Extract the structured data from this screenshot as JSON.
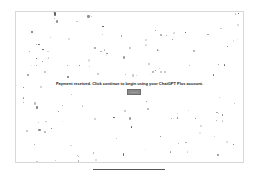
{
  "dialog": {
    "message": "Payment received. Click continue to begin using your ChatGPT Plus account.",
    "continue_label": "Continue"
  },
  "footer": {
    "text": "· · · · · · · · · · · · · · · ·"
  },
  "colors": {
    "button": "#8a8a8a",
    "confetti": [
      "#555555",
      "#777777",
      "#999999",
      "#bbbbbb",
      "#444444"
    ]
  }
}
